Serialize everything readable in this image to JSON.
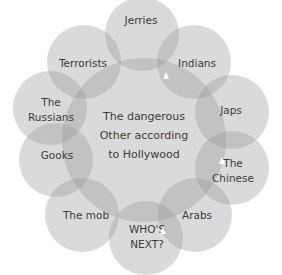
{
  "diagram": {
    "center": {
      "label": "The dangerous Other according to Hollywood",
      "lines": [
        "The dangerous",
        "Other according",
        "to Hollywood"
      ],
      "cx": 144,
      "cy": 140,
      "r": 82
    },
    "outer": [
      {
        "id": "jerries",
        "lines": [
          "Jerries"
        ],
        "cx": 142,
        "cy": 34,
        "lx": 141,
        "ly": 20
      },
      {
        "id": "indians",
        "lines": [
          "Indians"
        ],
        "cx": 194,
        "cy": 62,
        "lx": 197,
        "ly": 63
      },
      {
        "id": "japs",
        "lines": [
          "Japs"
        ],
        "cx": 232,
        "cy": 112,
        "lx": 231,
        "ly": 110
      },
      {
        "id": "chinese",
        "lines": [
          "The",
          "Chinese"
        ],
        "cx": 232,
        "cy": 168,
        "lx": 233,
        "ly": 171
      },
      {
        "id": "arabs",
        "lines": [
          "Arabs"
        ],
        "cx": 195,
        "cy": 215,
        "lx": 197,
        "ly": 215
      },
      {
        "id": "whos-next",
        "lines": [
          "WHO'S",
          "NEXT?"
        ],
        "cx": 146,
        "cy": 238,
        "lx": 147,
        "ly": 237
      },
      {
        "id": "the-mob",
        "lines": [
          "The mob"
        ],
        "cx": 82,
        "cy": 215,
        "lx": 86,
        "ly": 215
      },
      {
        "id": "gooks",
        "lines": [
          "Gooks"
        ],
        "cx": 56,
        "cy": 160,
        "lx": 57,
        "ly": 155
      },
      {
        "id": "russians",
        "lines": [
          "The",
          "Russians"
        ],
        "cx": 50,
        "cy": 108,
        "lx": 51,
        "ly": 110
      },
      {
        "id": "terrorists",
        "lines": [
          "Terrorists"
        ],
        "cx": 84,
        "cy": 62,
        "lx": 83,
        "ly": 63
      }
    ],
    "outer_radius": 37,
    "fill_color": "#969696"
  }
}
